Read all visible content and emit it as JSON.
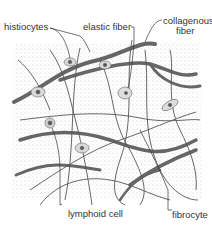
{
  "diagram": {
    "labels": {
      "histiocytes": "histiocytes",
      "elastic_fiber": "elastic fiber",
      "collagenous_fiber_line1": "collagenous",
      "collagenous_fiber_line2": "fiber",
      "lymphoid_cell": "lymphoid cell",
      "fibrocyte": "fibrocyte"
    },
    "colors": {
      "background_stipple": "#cfcfcf",
      "fiber": "#555555",
      "text": "#333333"
    }
  }
}
